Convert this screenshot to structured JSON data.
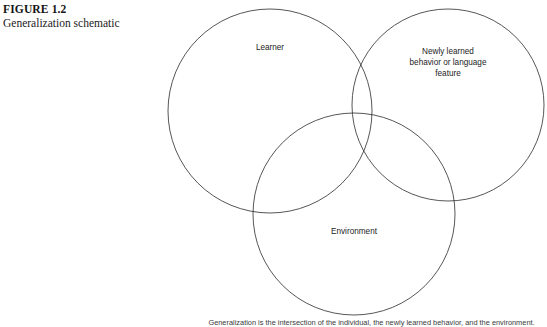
{
  "figure": {
    "number": "FIGURE 1.2",
    "title": "Generalization schematic"
  },
  "diagram": {
    "type": "venn-three-circle",
    "stroke_color": "#2b2b2b",
    "stroke_width": 0.8,
    "fill": "none",
    "background": "#ffffff",
    "circles": [
      {
        "id": "learner",
        "label": "Learner",
        "cx": 270,
        "cy": 111,
        "r": 102
      },
      {
        "id": "newly-learned",
        "label": "Newly learned\nbehavior or language\nfeature",
        "cx": 448,
        "cy": 105,
        "r": 96
      },
      {
        "id": "environment",
        "label": "Environment",
        "cx": 354,
        "cy": 214,
        "r": 101
      }
    ]
  },
  "footnote": {
    "text": "Generalization is the intersection of the individual, the newly learned behavior, and the environment."
  }
}
